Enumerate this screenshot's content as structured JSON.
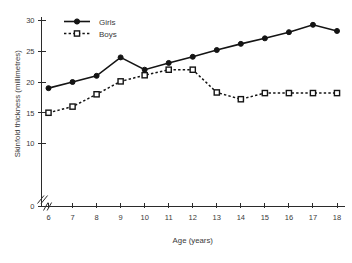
{
  "chart_data": {
    "type": "line",
    "title": "",
    "xlabel": "Age (years)",
    "ylabel": "Skinfold thickness (millimetres)",
    "x": [
      6,
      7,
      8,
      9,
      10,
      11,
      12,
      13,
      14,
      15,
      16,
      17,
      18
    ],
    "xtick_labels": [
      "6",
      "7",
      "8",
      "9",
      "10",
      "11",
      "12",
      "13",
      "14",
      "15",
      "16",
      "17",
      "18"
    ],
    "ytick_labels": [
      "0",
      "10",
      "15",
      "20",
      "25",
      "30"
    ],
    "ytick_values": [
      0,
      10,
      15,
      20,
      25,
      30
    ],
    "xlim": [
      6,
      18
    ],
    "ylim": [
      10,
      30
    ],
    "grid": false,
    "axis_break_x": true,
    "axis_break_y": true,
    "legend_position": "top-left",
    "series": [
      {
        "name": "Girls",
        "marker": "filled-circle",
        "line_style": "solid",
        "color": "#141414",
        "values": [
          19.0,
          20.0,
          21.0,
          24.0,
          22.0,
          23.1,
          24.1,
          25.2,
          26.2,
          27.1,
          28.1,
          29.3,
          28.3
        ]
      },
      {
        "name": "Boys",
        "marker": "open-square",
        "line_style": "dotted",
        "color": "#141414",
        "values": [
          15.0,
          16.0,
          18.0,
          20.1,
          21.1,
          22.0,
          22.0,
          18.3,
          17.2,
          18.2,
          18.2,
          18.2,
          18.2
        ]
      }
    ]
  },
  "legend": {
    "items": [
      {
        "label": "Girls"
      },
      {
        "label": "Boys"
      }
    ]
  }
}
